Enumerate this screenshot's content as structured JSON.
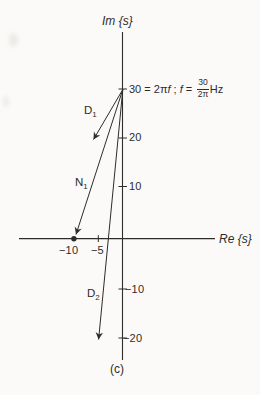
{
  "colors": {
    "ink": "#2e2c29",
    "paper": "#fbfaf8"
  },
  "axes": {
    "im_label": "Im {s}",
    "re_label": "Re {s}",
    "im_ticks": {
      "p20": "20",
      "p10": "10",
      "n10": "−10",
      "n20": "−20"
    },
    "re_ticks": {
      "n10": "−10",
      "n5": "−5"
    }
  },
  "annotation": {
    "lead": "30 = 2π",
    "f1": "f",
    "sep": " ; ",
    "f2": "f",
    "eq": " = ",
    "fraction": {
      "numerator": "30",
      "denominator": "2π"
    },
    "unit": "Hz"
  },
  "vectors": {
    "d1": {
      "name": "D",
      "sub": "1"
    },
    "n1": {
      "name": "N",
      "sub": "1"
    },
    "d2": {
      "name": "D",
      "sub": "2"
    }
  },
  "markers": {
    "zero_at": "−10 on real axis",
    "eval_point": "30 on imaginary axis"
  },
  "caption": "(c)"
}
